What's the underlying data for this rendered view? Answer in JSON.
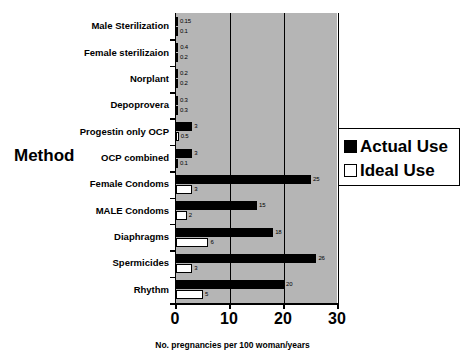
{
  "chart_data": {
    "type": "bar",
    "orientation": "horizontal",
    "title": "",
    "xlabel": "No. pregnancies per 100 woman/years",
    "ylabel": "Method",
    "xlim": [
      0,
      30
    ],
    "xticks": [
      "0",
      "10",
      "20",
      "30"
    ],
    "grid": true,
    "legend_position": "right",
    "categories": [
      "Male Sterilization",
      "Female sterilizaion",
      "Norplant",
      "Depoprovera",
      "Progestin only OCP",
      "OCP combined",
      "Female Condoms",
      "MALE Condoms",
      "Diaphragms",
      "Spermicides",
      "Rhythm"
    ],
    "series": [
      {
        "name": "Actual Use",
        "color": "#000000",
        "values": [
          0.15,
          0.4,
          0.2,
          0.3,
          3,
          3,
          25,
          15,
          18,
          26,
          20
        ],
        "labels": [
          "0.15",
          "0.4",
          "0.2",
          "0.3",
          "3",
          "3",
          "25",
          "15",
          "18",
          "26",
          "20"
        ]
      },
      {
        "name": "Ideal Use",
        "color": "#ffffff",
        "values": [
          0.1,
          0.2,
          0.2,
          0.3,
          0.5,
          0.1,
          3,
          2,
          6,
          3,
          5
        ],
        "labels": [
          "0.1",
          "0.2",
          "0.2",
          "0.3",
          "0.5",
          "0.1",
          "3",
          "2",
          "6",
          "3",
          "5"
        ]
      }
    ]
  },
  "legend": {
    "items": [
      {
        "label": "Actual Use",
        "swatch": "filled-square"
      },
      {
        "label": "Ideal Use",
        "swatch": "hollow-square"
      }
    ]
  },
  "axis": {
    "y_title": "Method",
    "x_title": "No. pregnancies per 100 woman/years"
  },
  "colors": {
    "plot_background": "#b5b5b5",
    "actual_use": "#000000",
    "ideal_use": "#ffffff",
    "axis": "#000000",
    "page_background": "#ffffff"
  }
}
